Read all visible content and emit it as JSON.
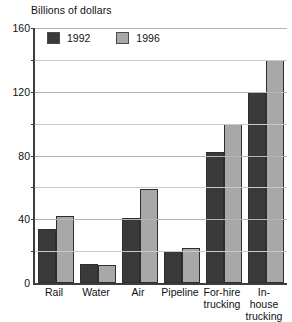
{
  "chart_data": {
    "type": "bar",
    "title": "Billions of dollars",
    "xlabel": "",
    "ylabel": "Billions of dollars",
    "categories": [
      "Rail",
      "Water",
      "Air",
      "Pipeline",
      "For-hire\ntrucking",
      "In-house\ntrucking"
    ],
    "series": [
      {
        "name": "1992",
        "color": "#3a3a3a",
        "values": [
          34,
          12,
          41,
          20,
          82,
          120
        ]
      },
      {
        "name": "1996",
        "color": "#a8a8a8",
        "values": [
          42,
          11,
          59,
          22,
          100,
          140
        ]
      }
    ],
    "ylim": [
      0,
      160
    ],
    "yticks": [
      0,
      40,
      80,
      120,
      160
    ],
    "ytick_labels": [
      "0",
      "40",
      "80",
      "120",
      "160"
    ],
    "yminor_ticks": [
      20,
      60,
      100,
      140
    ],
    "grid": true,
    "legend_position": "top-left",
    "legend_entries": [
      "1992",
      "1996"
    ]
  }
}
